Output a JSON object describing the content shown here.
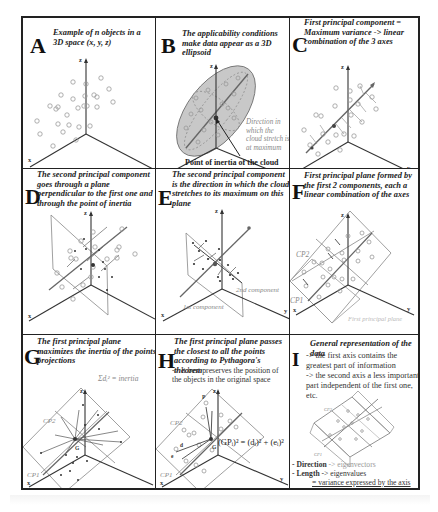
{
  "panels": {
    "A": {
      "letter": "A",
      "caption": "Example of n objects in a 3D space (x, y, z)",
      "axes": {
        "x": "x",
        "y": "y",
        "z": "z"
      }
    },
    "B": {
      "letter": "B",
      "caption": "The applicability conditions make data appear as a 3D ellipsoid",
      "note": "Direction in which the cloud stretch is at maximum",
      "label": "Point of inertia of the cloud",
      "axes": {
        "x": "x",
        "y": "y",
        "z": "z"
      }
    },
    "C": {
      "letter": "C",
      "caption": "First principal component = Maximum variance -> linear combination of the 3 axes",
      "axes": {
        "x": "x",
        "y": "y",
        "z": "z"
      }
    },
    "D": {
      "letter": "D",
      "caption": "The second principal component goes through a plane perpendicular to the first one and through the point of inertia",
      "axes": {
        "x": "x",
        "y": "y",
        "z": "z"
      }
    },
    "E": {
      "letter": "E",
      "caption": "The second principal component is the direction in which the cloud stretches to its maximum on this plane",
      "label_2nd": "2nd component",
      "label_1st": "1st component",
      "axes": {
        "x": "x",
        "y": "y",
        "z": "z"
      }
    },
    "F": {
      "letter": "F",
      "caption": "First principal plane formed by the first 2 components, each a linear combination of the axes",
      "cp1": "CP1",
      "cp2": "CP2",
      "plane_label": "First principal plane",
      "axes": {
        "x": "x",
        "y": "y",
        "z": "z"
      }
    },
    "G": {
      "letter": "G",
      "caption": "The first principal plane maximizes the inertia of the points' projections",
      "formula": "Σdᵢ² = inertia",
      "cp1": "CP1",
      "cp2": "CP2",
      "g": "G",
      "di": "dᵢ",
      "axes": {
        "x": "x",
        "y": "y",
        "z": "z"
      }
    },
    "H": {
      "letter": "H",
      "caption": "The first principal plane passes the closest to all the points according to Pythagora's theorem",
      "subtext": "-> It best preserves the position of the objects in the original space",
      "formula": "(GPᵢ)² = (dᵢ)² + (eᵢ)²",
      "cp1": "CP1",
      "cp2": "CP2",
      "g": "G",
      "pi": "Pᵢ",
      "di": "dᵢ",
      "ei": "eᵢ",
      "axes": {
        "x": "x",
        "y": "y",
        "z": "z"
      }
    },
    "I": {
      "letter": "I",
      "caption": "General representation of the data",
      "lines": [
        "-> the first axis contains the greatest part of information",
        "-> the second axis a less important part independent of the first one, etc."
      ],
      "cp1": "CP1",
      "cp2": "CP2",
      "direction_key": "- Direction",
      "direction_val": "-> eigenvectors",
      "length_key": "- Length",
      "length_val": "-> eigenvalues",
      "variance": "= variance expressed by the axis"
    }
  }
}
